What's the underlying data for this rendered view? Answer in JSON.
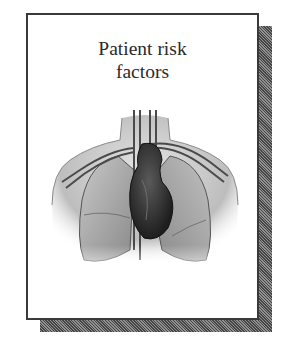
{
  "figure": {
    "title_line1": "Patient risk",
    "title_line2": "factors",
    "illustration": "anatomical-chest-heart-lungs",
    "colors": {
      "border": "#3a3a3a",
      "background": "#ffffff",
      "shadow": "#7a7a7a",
      "heart": "#2e2e2e",
      "lungs": "#9a9a9a"
    }
  }
}
